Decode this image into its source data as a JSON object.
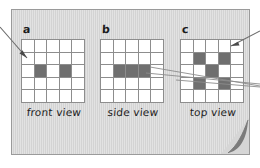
{
  "figure": {
    "background_color": "#ffffff",
    "card_color": "#d6d6d6",
    "card_border_color": "#9a9a9a",
    "grid_line_color": "#8d8d8d",
    "empty_cell_color": "#ffffff",
    "filled_cell_color": "#6f6f6f",
    "annotation_line_color": "#6b6b6b",
    "fold_color": "#7b7b7b"
  },
  "panels": [
    {
      "letter": "a",
      "caption": "front view",
      "rows": 5,
      "cols": 5,
      "filled_cells": [
        [
          2,
          1
        ],
        [
          2,
          3
        ]
      ]
    },
    {
      "letter": "b",
      "caption": "side view",
      "rows": 5,
      "cols": 5,
      "filled_cells": [
        [
          2,
          1
        ],
        [
          2,
          2
        ],
        [
          2,
          3
        ]
      ]
    },
    {
      "letter": "c",
      "caption": "top view",
      "rows": 5,
      "cols": 5,
      "filled_cells": [
        [
          1,
          1
        ],
        [
          1,
          3
        ],
        [
          2,
          2
        ],
        [
          3,
          1
        ],
        [
          3,
          3
        ]
      ]
    }
  ],
  "annotations": [
    {
      "name": "arrow-to-front-view",
      "style": "arrow"
    },
    {
      "name": "arrow-to-top-view",
      "style": "arrow"
    },
    {
      "name": "leader-line-side-to-right",
      "style": "line"
    },
    {
      "name": "leader-line-top-to-right",
      "style": "line"
    }
  ],
  "page_curl": {
    "name": "page-curl-corner",
    "position": "bottom-right"
  }
}
